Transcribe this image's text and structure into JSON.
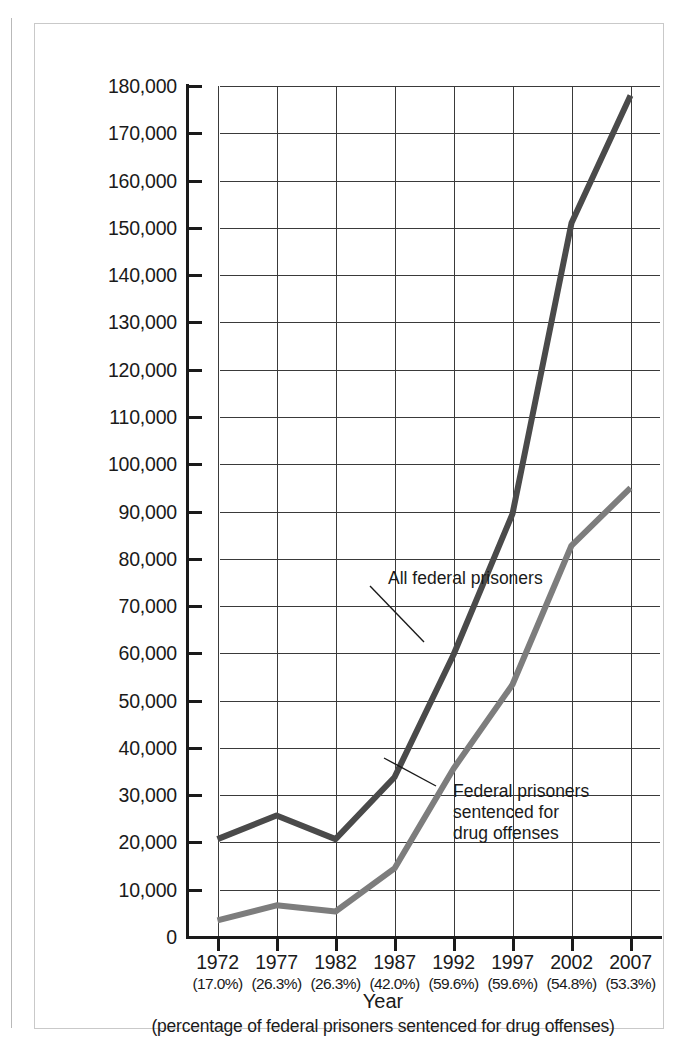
{
  "chart_data": {
    "type": "line",
    "title": "",
    "xlabel": "Year",
    "xlabel_sub": "(percentage of federal prisoners sentenced for drug offenses)",
    "ylabel": "",
    "ylim": [
      0,
      180000
    ],
    "ytick_step": 10000,
    "grid": true,
    "legend_position": "inline-annotations",
    "categories": [
      "1972",
      "1977",
      "1982",
      "1987",
      "1992",
      "1997",
      "2002",
      "2007"
    ],
    "category_sublabels": [
      "(17.0%)",
      "(26.3%)",
      "(26.3%)",
      "(42.0%)",
      "(59.6%)",
      "(59.6%)",
      "(54.8%)",
      "(53.3%)"
    ],
    "ytick_labels": [
      "0",
      "10,000",
      "20,000",
      "30,000",
      "40,000",
      "50,000",
      "60,000",
      "70,000",
      "80,000",
      "90,000",
      "100,000",
      "110,000",
      "120,000",
      "130,000",
      "140,000",
      "150,000",
      "160,000",
      "170,000",
      "180,000"
    ],
    "ytick_values": [
      0,
      10000,
      20000,
      30000,
      40000,
      50000,
      60000,
      70000,
      80000,
      90000,
      100000,
      110000,
      120000,
      130000,
      140000,
      150000,
      160000,
      170000,
      180000
    ],
    "series": [
      {
        "name": "All federal prisoners",
        "color": "#4a4a4a",
        "values": [
          20700,
          25700,
          20700,
          33800,
          59700,
          89500,
          151000,
          178000
        ]
      },
      {
        "name": "Federal prisoners sentenced for drug offenses",
        "color": "#7d7d7d",
        "values": [
          3500,
          6700,
          5400,
          14500,
          35600,
          53400,
          82800,
          95000
        ]
      }
    ],
    "annotations": [
      {
        "text": "All federal prisoners",
        "target_series": "All federal prisoners",
        "target_x": "1992"
      },
      {
        "text": "Federal prisoners\nsentenced for\ndrug offenses",
        "target_series": "Federal prisoners sentenced for drug offenses",
        "target_x": "1992"
      }
    ]
  }
}
